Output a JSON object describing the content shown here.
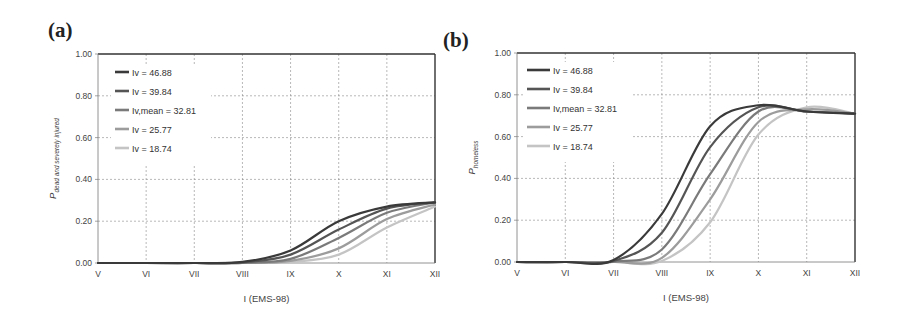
{
  "panels": {
    "a": {
      "label": "(a)"
    },
    "b": {
      "label": "(b)"
    }
  },
  "chart_data": [
    {
      "type": "line",
      "panel": "(a)",
      "title": "",
      "xlabel": "I (EMS-98)",
      "ylabel": "P dead and severely injured",
      "x": [
        "V",
        "VI",
        "VII",
        "VIII",
        "IX",
        "X",
        "XI",
        "XII"
      ],
      "ylim": [
        0,
        1.0
      ],
      "yticks": [
        "0.00",
        "0.20",
        "0.40",
        "0.60",
        "0.80",
        "1.00"
      ],
      "grid": true,
      "legend_position": "upper-left",
      "series": [
        {
          "name": "Iv = 46.88",
          "color": "#3a3a3a",
          "values": [
            0,
            0,
            0,
            0.005,
            0.06,
            0.2,
            0.27,
            0.29
          ]
        },
        {
          "name": "Iv = 39.84",
          "color": "#555555",
          "values": [
            0,
            0,
            0,
            0.003,
            0.04,
            0.16,
            0.26,
            0.29
          ]
        },
        {
          "name": "Iv,mean = 32.81",
          "color": "#7a7a7a",
          "values": [
            0,
            0,
            0,
            0.001,
            0.02,
            0.12,
            0.24,
            0.29
          ]
        },
        {
          "name": "Iv = 25.77",
          "color": "#9c9c9c",
          "values": [
            0,
            0,
            0,
            0,
            0.01,
            0.07,
            0.21,
            0.28
          ]
        },
        {
          "name": "Iv = 18.74",
          "color": "#c4c4c4",
          "values": [
            0,
            0,
            0,
            0,
            0.005,
            0.04,
            0.17,
            0.27
          ]
        }
      ],
      "legend": [
        {
          "label": "Iv = 46.88"
        },
        {
          "label": "Iv = 39.84"
        },
        {
          "label": "Iv,mean = 32.81"
        },
        {
          "label": "Iv = 25.77"
        },
        {
          "label": "Iv = 18.74"
        }
      ]
    },
    {
      "type": "line",
      "panel": "(b)",
      "title": "",
      "xlabel": "I (EMS-98)",
      "ylabel": "P homeless",
      "x": [
        "V",
        "VI",
        "VII",
        "VIII",
        "IX",
        "X",
        "XI",
        "XII"
      ],
      "ylim": [
        0,
        1.0
      ],
      "yticks": [
        "0.00",
        "0.20",
        "0.40",
        "0.60",
        "0.80",
        "1.00"
      ],
      "grid": true,
      "legend_position": "upper-left",
      "series": [
        {
          "name": "Iv = 46.88",
          "color": "#3a3a3a",
          "values": [
            0,
            0,
            0.01,
            0.23,
            0.65,
            0.75,
            0.72,
            0.71
          ]
        },
        {
          "name": "Iv = 39.84",
          "color": "#555555",
          "values": [
            0,
            0,
            0.005,
            0.14,
            0.55,
            0.74,
            0.72,
            0.71
          ]
        },
        {
          "name": "Iv,mean = 32.81",
          "color": "#7a7a7a",
          "values": [
            0,
            0,
            0.002,
            0.06,
            0.42,
            0.72,
            0.72,
            0.71
          ]
        },
        {
          "name": "Iv = 25.77",
          "color": "#9c9c9c",
          "values": [
            0,
            0,
            0,
            0.02,
            0.3,
            0.67,
            0.73,
            0.71
          ]
        },
        {
          "name": "Iv = 18.74",
          "color": "#c4c4c4",
          "values": [
            0,
            0,
            0,
            0.005,
            0.19,
            0.61,
            0.74,
            0.71
          ]
        }
      ],
      "legend": [
        {
          "label": "Iv = 46.88"
        },
        {
          "label": "Iv = 39.84"
        },
        {
          "label": "Iv,mean = 32.81"
        },
        {
          "label": "Iv = 25.77"
        },
        {
          "label": "Iv = 18.74"
        }
      ]
    }
  ]
}
